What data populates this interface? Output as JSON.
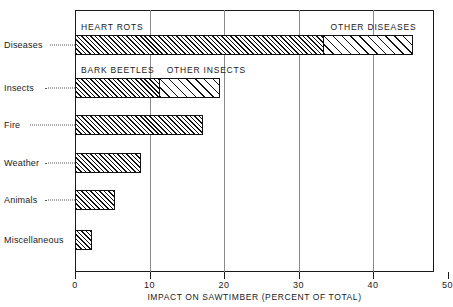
{
  "chart_data": {
    "type": "bar",
    "orientation": "horizontal",
    "title": "",
    "xlabel": "IMPACT ON SAWTIMBER (PERCENT OF TOTAL)",
    "ylabel": "",
    "xlim": [
      0,
      50
    ],
    "xticks": [
      0,
      10,
      20,
      30,
      40,
      50
    ],
    "xtick_labels": [
      "0",
      "10",
      "20",
      "30",
      "40",
      "50"
    ],
    "grid": true,
    "grid_axis": "x",
    "legend": "inline-segment-labels",
    "categories": [
      "Diseases",
      "Insects",
      "Fire",
      "Weather",
      "Animals",
      "Miscellaneous"
    ],
    "category_labels": [
      "Diseases",
      "Insects",
      "Fire",
      "Weather",
      "Animals",
      "Miscellaneous"
    ],
    "values": [
      45.5,
      19.6,
      17.2,
      8.8,
      5.4,
      2.3
    ],
    "stacked": true,
    "bars": [
      {
        "category": "Diseases",
        "total": 45.5,
        "segments": [
          {
            "label": "HEART ROTS",
            "value": 33.5,
            "fill": "hatch-dense"
          },
          {
            "label": "OTHER DISEASES",
            "value": 12.0,
            "fill": "hatch-sparse"
          }
        ]
      },
      {
        "category": "Insects",
        "total": 19.6,
        "segments": [
          {
            "label": "BARK BEETLES",
            "value": 11.5,
            "fill": "hatch-dense"
          },
          {
            "label": "OTHER INSECTS",
            "value": 8.1,
            "fill": "hatch-sparse"
          }
        ]
      },
      {
        "category": "Fire",
        "total": 17.2,
        "segments": [
          {
            "label": "",
            "value": 17.2,
            "fill": "hatch-dense"
          }
        ]
      },
      {
        "category": "Weather",
        "total": 8.8,
        "segments": [
          {
            "label": "",
            "value": 8.8,
            "fill": "hatch-dense"
          }
        ]
      },
      {
        "category": "Animals",
        "total": 5.4,
        "segments": [
          {
            "label": "",
            "value": 5.4,
            "fill": "hatch-dense"
          }
        ]
      },
      {
        "category": "Miscellaneous",
        "total": 2.3,
        "segments": [
          {
            "label": "",
            "value": 2.3,
            "fill": "hatch-dense"
          }
        ]
      }
    ],
    "segment_labels": [
      "HEART ROTS",
      "OTHER DISEASES",
      "BARK BEETLES",
      "OTHER INSECTS"
    ]
  },
  "colors": {
    "axis": "#1a1a1a",
    "grid": "#8a8a8a",
    "bar_outline": "#111111",
    "background": "#ffffff"
  }
}
